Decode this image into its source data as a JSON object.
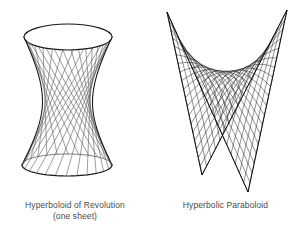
{
  "page": {
    "background_color": "#ffffff",
    "ink_color": "#1a1a1a",
    "caption_color": "#4a4a4a",
    "width": 301,
    "height": 243
  },
  "figures": [
    {
      "id": "hyperboloid",
      "name": "hyperboloid-of-revolution",
      "caption_line1": "Hyperboloid of Revolution",
      "caption_line2": "(one sheet)",
      "render_style": "ruled-straight-lines",
      "geometry": {
        "top_ellipse": {
          "cx": 68,
          "cy": 37,
          "rx": 44,
          "ry": 13
        },
        "bottom_ellipse": {
          "cx": 67,
          "cy": 165,
          "rx": 45,
          "ry": 11
        },
        "waist": {
          "cy": 102,
          "half_width": 25
        },
        "ruling_count": 26,
        "twist_fraction": 0.33
      }
    },
    {
      "id": "paraboloid",
      "name": "hyperbolic-paraboloid",
      "caption_line1": "Hyperbolic Paraboloid",
      "caption_line2": "",
      "render_style": "wireframe-mesh",
      "geometry": {
        "peak_left": {
          "x": 167,
          "y": 12
        },
        "peak_right": {
          "x": 287,
          "y": 10
        },
        "dip_front": {
          "x": 202,
          "y": 175
        },
        "dip_back": {
          "x": 248,
          "y": 192
        },
        "saddle_center": {
          "x": 228,
          "y": 103
        },
        "mesh_u_lines": 19,
        "mesh_v_lines": 19
      }
    }
  ],
  "chart_data": {
    "type": "diagram",
    "items": [
      {
        "label": "Hyperboloid of Revolution (one sheet)",
        "equation": "x^2/a^2 + y^2/b^2 - z^2/c^2 = 1",
        "ruled": true
      },
      {
        "label": "Hyperbolic Paraboloid",
        "equation": "z = y^2/b^2 - x^2/a^2",
        "ruled": true
      }
    ]
  }
}
